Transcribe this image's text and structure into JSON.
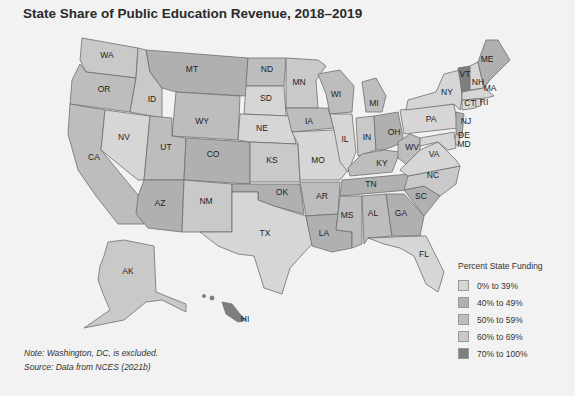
{
  "title": "State Share of Public Education Revenue, 2018–2019",
  "legend": {
    "title": "Percent State Funding",
    "items": [
      {
        "label": "0% to 39%",
        "color": "#d6d6d6"
      },
      {
        "label": "40% to 49%",
        "color": "#b0b0b0"
      },
      {
        "label": "50% to 59%",
        "color": "#bdbdbd"
      },
      {
        "label": "60% to 69%",
        "color": "#c9c9c9"
      },
      {
        "label": "70% to 100%",
        "color": "#7e7e7e"
      }
    ]
  },
  "note": {
    "line1": "Note: Washington, DC, is excluded.",
    "line2": "Source: Data from NCES (2021b)"
  },
  "states": {
    "WA": {
      "label": "WA",
      "category": "60% to 69%"
    },
    "OR": {
      "label": "OR",
      "category": "50% to 59%"
    },
    "CA": {
      "label": "CA",
      "category": "50% to 59%"
    },
    "ID": {
      "label": "ID",
      "category": "60% to 69%"
    },
    "NV": {
      "label": "NV",
      "category": "0% to 39%"
    },
    "MT": {
      "label": "MT",
      "category": "40% to 49%"
    },
    "WY": {
      "label": "WY",
      "category": "50% to 59%"
    },
    "UT": {
      "label": "UT",
      "category": "50% to 59%"
    },
    "CO": {
      "label": "CO",
      "category": "40% to 49%"
    },
    "AZ": {
      "label": "AZ",
      "category": "40% to 49%"
    },
    "NM": {
      "label": "NM",
      "category": "60% to 69%"
    },
    "ND": {
      "label": "ND",
      "category": "50% to 59%"
    },
    "SD": {
      "label": "SD",
      "category": "0% to 39%"
    },
    "NE": {
      "label": "NE",
      "category": "0% to 39%"
    },
    "KS": {
      "label": "KS",
      "category": "60% to 69%"
    },
    "OK": {
      "label": "OK",
      "category": "40% to 49%"
    },
    "TX": {
      "label": "TX",
      "category": "0% to 39%"
    },
    "MN": {
      "label": "MN",
      "category": "60% to 69%"
    },
    "IA": {
      "label": "IA",
      "category": "50% to 59%"
    },
    "MO": {
      "label": "MO",
      "category": "0% to 39%"
    },
    "AR": {
      "label": "AR",
      "category": "50% to 59%"
    },
    "LA": {
      "label": "LA",
      "category": "40% to 49%"
    },
    "WI": {
      "label": "WI",
      "category": "50% to 59%"
    },
    "IL": {
      "label": "IL",
      "category": "0% to 39%"
    },
    "MI": {
      "label": "MI",
      "category": "50% to 59%"
    },
    "IN": {
      "label": "IN",
      "category": "60% to 69%"
    },
    "OH": {
      "label": "OH",
      "category": "40% to 49%"
    },
    "KY": {
      "label": "KY",
      "category": "50% to 59%"
    },
    "TN": {
      "label": "TN",
      "category": "40% to 49%"
    },
    "MS": {
      "label": "MS",
      "category": "50% to 59%"
    },
    "AL": {
      "label": "AL",
      "category": "50% to 59%"
    },
    "GA": {
      "label": "GA",
      "category": "40% to 49%"
    },
    "FL": {
      "label": "FL",
      "category": "0% to 39%"
    },
    "SC": {
      "label": "SC",
      "category": "40% to 49%"
    },
    "NC": {
      "label": "NC",
      "category": "60% to 69%"
    },
    "VA": {
      "label": "VA",
      "category": "0% to 39%"
    },
    "WV": {
      "label": "WV",
      "category": "50% to 59%"
    },
    "PA": {
      "label": "PA",
      "category": "0% to 39%"
    },
    "NY": {
      "label": "NY",
      "category": "0% to 39%"
    },
    "VT": {
      "label": "VT",
      "category": "70% to 100%"
    },
    "NH": {
      "label": "NH",
      "category": "0% to 39%"
    },
    "ME": {
      "label": "ME",
      "category": "40% to 49%"
    },
    "MA": {
      "label": "MA",
      "category": "0% to 39%"
    },
    "RI": {
      "label": "RI",
      "category": "0% to 39%"
    },
    "CT": {
      "label": "CT",
      "category": "0% to 39%"
    },
    "NJ": {
      "label": "NJ",
      "category": "40% to 49%"
    },
    "DE": {
      "label": "DE",
      "category": "60% to 69%"
    },
    "MD": {
      "label": "MD",
      "category": "0% to 39%"
    },
    "AK": {
      "label": "AK",
      "category": "60% to 69%"
    },
    "HI": {
      "label": "HI",
      "category": "70% to 100%"
    }
  }
}
